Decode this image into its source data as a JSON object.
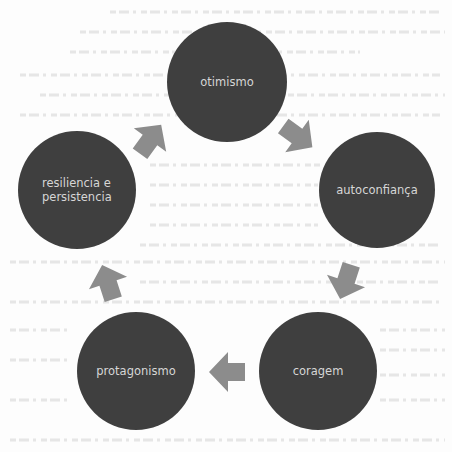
{
  "diagram": {
    "type": "cycle",
    "colors": {
      "background": "#fdfdfd",
      "node_fill": "#3f3f3f",
      "node_text": "#d6d6d6",
      "arrow_fill": "#8c8c8c"
    },
    "nodes": [
      {
        "id": "otimismo",
        "lines": [
          "otimismo"
        ],
        "cx": 227,
        "cy": 82,
        "r": 60
      },
      {
        "id": "autoconfianca",
        "lines": [
          "autoconfiança"
        ],
        "cx": 377,
        "cy": 190,
        "r": 58
      },
      {
        "id": "coragem",
        "lines": [
          "coragem"
        ],
        "cx": 318,
        "cy": 371,
        "r": 59
      },
      {
        "id": "protagonismo",
        "lines": [
          "protagonismo"
        ],
        "cx": 136,
        "cy": 371,
        "r": 59
      },
      {
        "id": "resiliencia-e-persistencia",
        "lines": [
          "resiliencia e",
          "persistencia"
        ],
        "cx": 77,
        "cy": 190,
        "r": 59
      }
    ],
    "edges": [
      {
        "from": "otimismo",
        "to": "autoconfianca",
        "arrow_icon": "arrow-down-right-icon",
        "cx": 297,
        "cy": 136,
        "angle": 36
      },
      {
        "from": "autoconfianca",
        "to": "coragem",
        "arrow_icon": "arrow-down-icon",
        "cx": 346,
        "cy": 281,
        "angle": 108
      },
      {
        "from": "coragem",
        "to": "protagonismo",
        "arrow_icon": "arrow-left-icon",
        "cx": 228,
        "cy": 372,
        "angle": 180
      },
      {
        "from": "protagonismo",
        "to": "resiliencia-e-persistencia",
        "arrow_icon": "arrow-up-icon",
        "cx": 108,
        "cy": 283,
        "angle": -108
      },
      {
        "from": "resiliencia-e-persistencia",
        "to": "otimismo",
        "arrow_icon": "arrow-up-right-icon",
        "cx": 150,
        "cy": 140,
        "angle": -54
      }
    ]
  }
}
